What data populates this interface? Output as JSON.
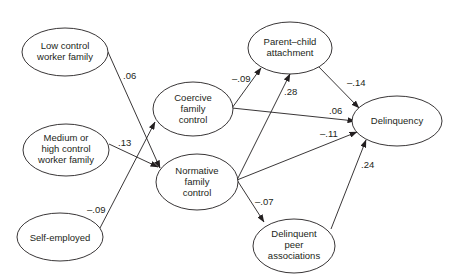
{
  "diagram": {
    "type": "path-diagram",
    "nodes": [
      {
        "id": "low",
        "lines": [
          "Low control",
          "worker family"
        ]
      },
      {
        "id": "medium",
        "lines": [
          "Medium or",
          "high control",
          "worker family"
        ]
      },
      {
        "id": "self",
        "lines": [
          "Self-employed"
        ]
      },
      {
        "id": "coercive",
        "lines": [
          "Coercive",
          "family",
          "control"
        ]
      },
      {
        "id": "normative",
        "lines": [
          "Normative",
          "family",
          "control"
        ]
      },
      {
        "id": "parent",
        "lines": [
          "Parent–child",
          "attachment"
        ]
      },
      {
        "id": "delinquency",
        "lines": [
          "Delinquency"
        ]
      },
      {
        "id": "peer",
        "lines": [
          "Delinquent",
          "peer",
          "associations"
        ]
      }
    ],
    "edges": [
      {
        "from": "low",
        "to": "normative",
        "label": ".06"
      },
      {
        "from": "medium",
        "to": "normative",
        "label": ".13"
      },
      {
        "from": "self",
        "to": "coercive",
        "label": "–.09"
      },
      {
        "from": "coercive",
        "to": "parent",
        "label": "–.09"
      },
      {
        "from": "coercive",
        "to": "delinquency",
        "label": ".06"
      },
      {
        "from": "normative",
        "to": "parent",
        "label": ".28"
      },
      {
        "from": "normative",
        "to": "delinquency",
        "label": "–.11"
      },
      {
        "from": "normative",
        "to": "peer",
        "label": "–.07"
      },
      {
        "from": "parent",
        "to": "delinquency",
        "label": "–.14"
      },
      {
        "from": "peer",
        "to": "delinquency",
        "label": ".24"
      }
    ]
  }
}
